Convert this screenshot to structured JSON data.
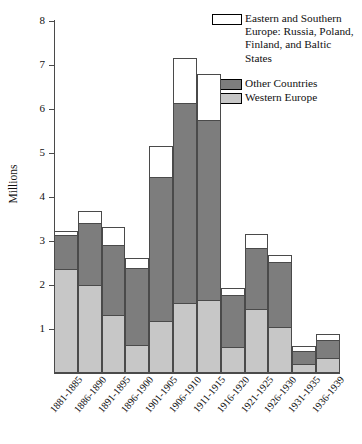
{
  "chart_data": {
    "type": "bar",
    "subtype": "stacked-bar",
    "title": "",
    "xlabel": "",
    "ylabel": "Millions",
    "ylim": [
      0,
      8
    ],
    "yticks": [
      0,
      1,
      2,
      3,
      4,
      5,
      6,
      7,
      8
    ],
    "ytick_labels": [
      "",
      "1",
      "2",
      "3",
      "4",
      "5",
      "6",
      "7",
      "8"
    ],
    "grid": false,
    "legend_position": "top-right",
    "categories": [
      "1881-1885",
      "1886-1890",
      "1891-1895",
      "1896-1900",
      "1901-1905",
      "1906-1910",
      "1911-1915",
      "1916-1920",
      "1921-1925",
      "1926-1930",
      "1931-1935",
      "1936-1939"
    ],
    "series": [
      {
        "name": "Western Europe",
        "color": "#c7c7c7",
        "values": [
          2.36,
          2.0,
          1.32,
          0.64,
          1.18,
          1.59,
          1.66,
          0.59,
          1.45,
          1.05,
          0.21,
          0.33
        ]
      },
      {
        "name": "Other Countries",
        "color": "#7d7d7d",
        "values": [
          0.8,
          1.43,
          1.61,
          1.77,
          3.3,
          4.56,
          4.11,
          1.21,
          1.42,
          1.49,
          0.31,
          0.45
        ]
      },
      {
        "name": "Eastern and Southern Europe: Russia, Poland, Finland, and Baltic States",
        "color": "#ffffff",
        "values": [
          0.11,
          0.3,
          0.43,
          0.25,
          0.72,
          1.05,
          1.08,
          0.18,
          0.33,
          0.18,
          0.15,
          0.15
        ]
      }
    ],
    "totals": [
      3.27,
      3.73,
      3.36,
      2.66,
      5.2,
      7.2,
      6.85,
      1.98,
      3.2,
      2.72,
      0.67,
      0.93
    ]
  },
  "legend": {
    "entries": [
      {
        "swatch": "white",
        "label": "Eastern and Southern Europe: Russia, Poland, Finland, and Baltic States"
      },
      {
        "swatch": "dark",
        "label": "Other Countries"
      },
      {
        "swatch": "light",
        "label": "Western Europe"
      }
    ]
  },
  "axis": {
    "y_title": "Millions"
  }
}
